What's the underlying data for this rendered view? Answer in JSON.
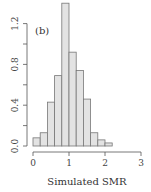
{
  "chart_data": {
    "type": "bar",
    "histogram": true,
    "title": "",
    "panel_label": "(b)",
    "xlabel": "Simulated SMR",
    "ylabel": "",
    "xlim": [
      0,
      3
    ],
    "ylim": [
      0,
      1.4
    ],
    "bin_width": 0.2,
    "bins": [
      {
        "from": 0.0,
        "to": 0.2,
        "value": 0.08
      },
      {
        "from": 0.2,
        "to": 0.4,
        "value": 0.13
      },
      {
        "from": 0.4,
        "to": 0.6,
        "value": 0.43
      },
      {
        "from": 0.6,
        "to": 0.8,
        "value": 0.69
      },
      {
        "from": 0.8,
        "to": 1.0,
        "value": 1.4
      },
      {
        "from": 1.0,
        "to": 1.2,
        "value": 0.92
      },
      {
        "from": 1.2,
        "to": 1.4,
        "value": 0.74
      },
      {
        "from": 1.4,
        "to": 1.6,
        "value": 0.46
      },
      {
        "from": 1.6,
        "to": 1.8,
        "value": 0.13
      },
      {
        "from": 1.8,
        "to": 2.0,
        "value": 0.06
      },
      {
        "from": 2.0,
        "to": 2.2,
        "value": 0.03
      }
    ],
    "x_ticks": [
      0,
      1,
      2,
      3
    ],
    "x_tick_labels": [
      "0",
      "1",
      "2",
      "3"
    ],
    "y_ticks": [
      0.0,
      0.2,
      0.4,
      0.6,
      0.8,
      1.0,
      1.2
    ],
    "y_tick_labels": [
      "0.0",
      "",
      "0.4",
      "",
      "0.8",
      "",
      "1.2"
    ],
    "grid": false,
    "colors": {
      "bar_fill": "#e3e3e3",
      "bar_stroke": "#777777",
      "axis": "#555555"
    }
  }
}
